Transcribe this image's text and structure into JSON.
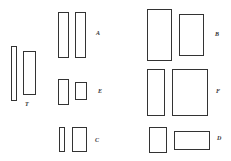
{
  "figure": {
    "groups": [
      {
        "label": "T",
        "label_pos": [
          25,
          101
        ],
        "rects": [
          [
            11,
            46,
            6,
            55
          ],
          [
            23,
            51,
            13,
            44
          ]
        ]
      },
      {
        "label": "A",
        "label_pos": [
          96,
          30
        ],
        "rects": [
          [
            58,
            12,
            11,
            46
          ],
          [
            75,
            12,
            11,
            46
          ]
        ]
      },
      {
        "label": "E",
        "label_pos": [
          98,
          88
        ],
        "rects": [
          [
            58,
            79,
            11,
            26
          ],
          [
            75,
            82,
            12,
            18
          ]
        ]
      },
      {
        "label": "C",
        "label_pos": [
          95,
          137
        ],
        "rects": [
          [
            59,
            127,
            6,
            25
          ],
          [
            72,
            127,
            15,
            25
          ]
        ]
      },
      {
        "label": "B",
        "label_pos": [
          215,
          31
        ],
        "rects": [
          [
            147,
            9,
            25,
            52
          ],
          [
            179,
            14,
            25,
            42
          ]
        ]
      },
      {
        "label": "F",
        "label_pos": [
          216,
          88
        ],
        "rects": [
          [
            147,
            69,
            18,
            47
          ],
          [
            172,
            69,
            36,
            47
          ]
        ]
      },
      {
        "label": "D",
        "label_pos": [
          217,
          135
        ],
        "rects": [
          [
            149,
            127,
            18,
            26
          ],
          [
            174,
            131,
            36,
            19
          ]
        ]
      }
    ]
  }
}
